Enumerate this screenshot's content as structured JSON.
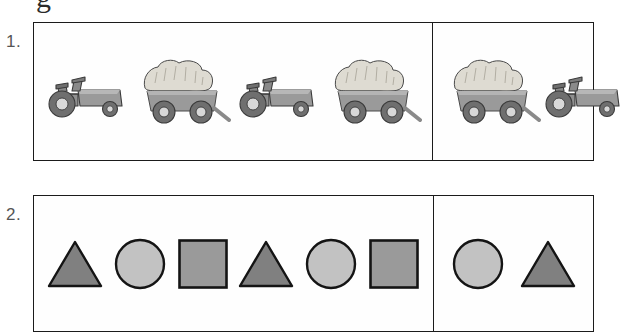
{
  "page": {
    "cut_off_glyph": "g",
    "background_color": "#ffffff",
    "ink_color": "#1b1b1b"
  },
  "problems": [
    {
      "number": "1.",
      "kind": "picture-pattern",
      "sequence": [
        {
          "item": "tractor",
          "label": "tractor"
        },
        {
          "item": "hay-wagon",
          "label": "wagon of hay"
        },
        {
          "item": "tractor",
          "label": "tractor"
        },
        {
          "item": "hay-wagon",
          "label": "wagon of hay"
        }
      ],
      "answer": [
        {
          "item": "hay-wagon",
          "label": "wagon of hay"
        },
        {
          "item": "tractor",
          "label": "tractor"
        }
      ],
      "colors": {
        "body": "#9a9a9a",
        "body_light": "#b4b4b4",
        "body_dark": "#7c7c7c",
        "hay": "#d9d6cd",
        "hay_shadow": "#bcb8ad",
        "wheel": "#6f6f6f",
        "wheel_hub": "#d5d5d5",
        "outline": "#3a3a3a"
      }
    },
    {
      "number": "2.",
      "kind": "shape-pattern",
      "sequence": [
        {
          "item": "triangle",
          "label": "triangle",
          "fill": "#808080"
        },
        {
          "item": "circle",
          "label": "circle",
          "fill": "#c2c2c2"
        },
        {
          "item": "square",
          "label": "square",
          "fill": "#9a9a9a"
        },
        {
          "item": "triangle",
          "label": "triangle",
          "fill": "#808080"
        },
        {
          "item": "circle",
          "label": "circle",
          "fill": "#c2c2c2"
        },
        {
          "item": "square",
          "label": "square",
          "fill": "#9a9a9a"
        }
      ],
      "answer": [
        {
          "item": "circle",
          "label": "circle",
          "fill": "#c2c2c2"
        },
        {
          "item": "triangle",
          "label": "triangle",
          "fill": "#808080"
        }
      ],
      "colors": {
        "triangle_fill": "#808080",
        "circle_fill": "#c2c2c2",
        "square_fill": "#9a9a9a",
        "outline": "#141414"
      }
    }
  ]
}
